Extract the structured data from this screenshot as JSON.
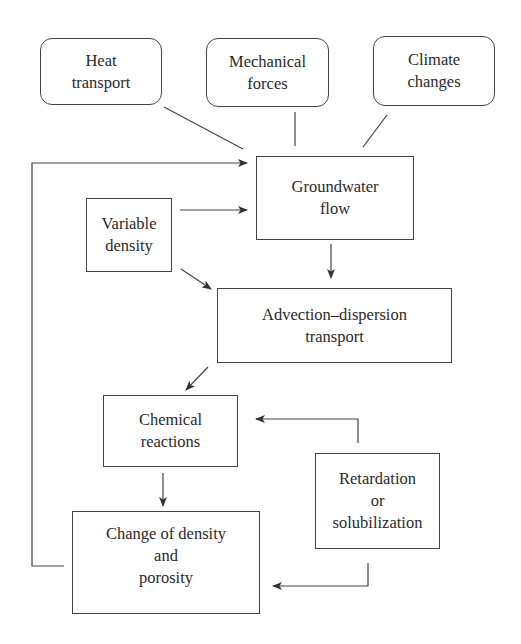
{
  "diagram": {
    "type": "flowchart",
    "nodes": {
      "heat_transport": {
        "lines": [
          "Heat",
          "transport"
        ],
        "shape": "rounded"
      },
      "mechanical_forces": {
        "lines": [
          "Mechanical",
          "forces"
        ],
        "shape": "rounded"
      },
      "climate_changes": {
        "lines": [
          "Climate",
          "changes"
        ],
        "shape": "rounded"
      },
      "groundwater_flow": {
        "lines": [
          "Groundwater",
          "flow"
        ],
        "shape": "rect"
      },
      "variable_density": {
        "lines": [
          "Variable",
          "density"
        ],
        "shape": "rect"
      },
      "advection_dispersion": {
        "lines": [
          "Advection–dispersion",
          "transport"
        ],
        "shape": "rect"
      },
      "chemical_reactions": {
        "lines": [
          "Chemical",
          "reactions"
        ],
        "shape": "rect"
      },
      "retardation": {
        "lines": [
          "Retardation",
          "or",
          "solubilization"
        ],
        "shape": "rect"
      },
      "change_density": {
        "lines": [
          "Change of density",
          "and",
          "porosity"
        ],
        "shape": "rect"
      }
    },
    "edges": [
      {
        "from": "heat_transport",
        "to": "groundwater_flow",
        "arrow": false
      },
      {
        "from": "mechanical_forces",
        "to": "groundwater_flow",
        "arrow": false
      },
      {
        "from": "climate_changes",
        "to": "groundwater_flow",
        "arrow": false
      },
      {
        "from": "variable_density",
        "to": "groundwater_flow",
        "arrow": true
      },
      {
        "from": "variable_density",
        "to": "advection_dispersion",
        "arrow": true
      },
      {
        "from": "groundwater_flow",
        "to": "advection_dispersion",
        "arrow": true
      },
      {
        "from": "advection_dispersion",
        "to": "chemical_reactions",
        "arrow": true
      },
      {
        "from": "chemical_reactions",
        "to": "change_density",
        "arrow": true
      },
      {
        "from": "retardation",
        "to": "chemical_reactions",
        "arrow": true
      },
      {
        "from": "retardation",
        "to": "change_density",
        "arrow": true
      },
      {
        "from": "change_density",
        "to": "groundwater_flow",
        "arrow": true,
        "route": "left feedback loop"
      }
    ]
  }
}
